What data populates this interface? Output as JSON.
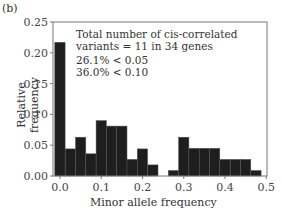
{
  "panel_label": "(b)",
  "annotation": {
    "line1": "Total number of  cis-correlated",
    "line2": "variants = 11 in 34 genes",
    "line3": "26.1% < 0.05",
    "line4": "36.0% < 0.10"
  },
  "axes": {
    "xlabel": "Minor allele frequency",
    "ylabel": "Relative frequency",
    "xticks": [
      "0.0",
      "0.1",
      "0.2",
      "0.3",
      "0.4",
      "0.5"
    ],
    "yticks": [
      "0.00",
      "0.05",
      "0.10",
      "0.15",
      "0.20",
      "0.25"
    ]
  },
  "colors": {
    "bar": "#1e1e1e",
    "axis": "#555555",
    "text": "#333333"
  },
  "chart_data": {
    "type": "bar",
    "title": "",
    "panel": "(b)",
    "xlabel": "Minor allele frequency",
    "ylabel": "Relative frequency",
    "xlim": [
      0.0,
      0.5
    ],
    "ylim": [
      0.0,
      0.25
    ],
    "bin_width": 0.025,
    "bins_start": [
      -0.0125,
      0.0125,
      0.0375,
      0.0625,
      0.0875,
      0.1125,
      0.1375,
      0.1625,
      0.1875,
      0.2125,
      0.2375,
      0.2625,
      0.2875,
      0.3125,
      0.3375,
      0.3625,
      0.3875,
      0.4125,
      0.4375,
      0.4625
    ],
    "values": [
      0.217,
      0.044,
      0.063,
      0.036,
      0.09,
      0.081,
      0.081,
      0.027,
      0.044,
      0.018,
      0.0,
      0.009,
      0.063,
      0.045,
      0.045,
      0.045,
      0.027,
      0.027,
      0.027,
      0.009
    ],
    "annotations": [
      "Total number of cis-correlated variants = 11 in 34 genes",
      "26.1% < 0.05",
      "36.0% < 0.10"
    ],
    "grid": false,
    "legend": null
  }
}
